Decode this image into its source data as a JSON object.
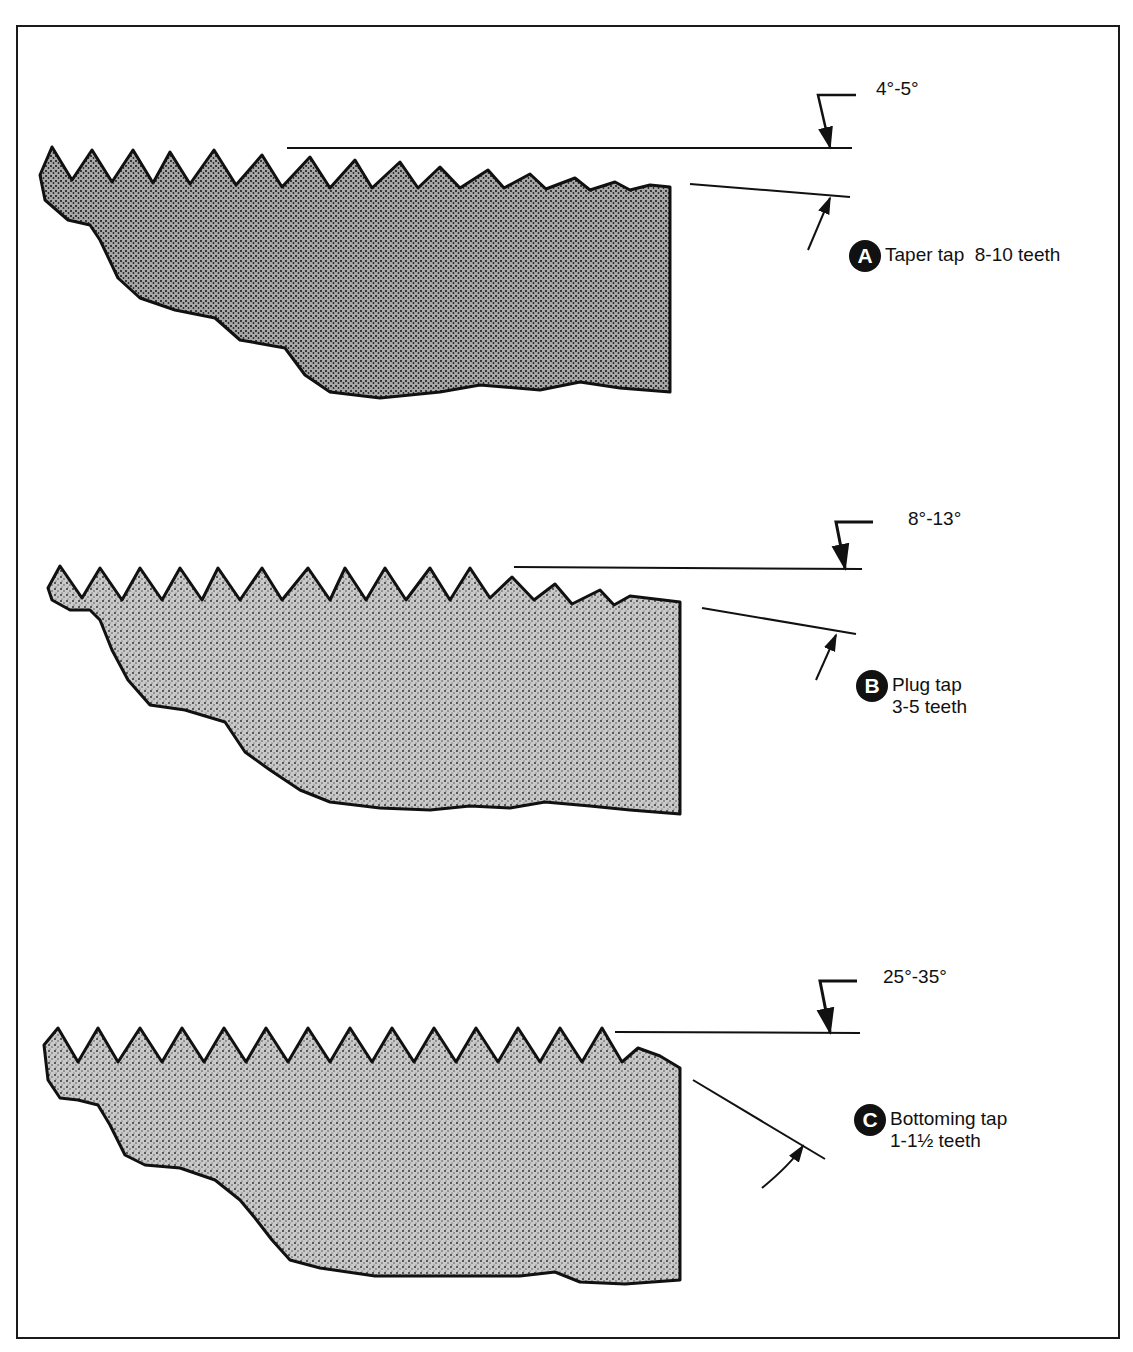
{
  "figure": {
    "panels": [
      {
        "id": "A",
        "badge": "A",
        "name": "Taper tap",
        "teeth": "8-10 teeth",
        "caption_line1": "Taper tap  8-10 teeth",
        "caption_line2": "",
        "angle": "4°-5°"
      },
      {
        "id": "B",
        "badge": "B",
        "name": "Plug tap",
        "teeth": "3-5 teeth",
        "caption_line1": "Plug tap",
        "caption_line2": "3-5 teeth",
        "angle": "8°-13°"
      },
      {
        "id": "C",
        "badge": "C",
        "name": "Bottoming tap",
        "teeth": "1-1½ teeth",
        "caption_line1": "Bottoming tap",
        "caption_line2": "1-1½ teeth",
        "angle": "25°-35°"
      }
    ],
    "colors": {
      "ink": "#111111",
      "stipple_fill": "#9a9a9a",
      "background": "#ffffff"
    }
  }
}
